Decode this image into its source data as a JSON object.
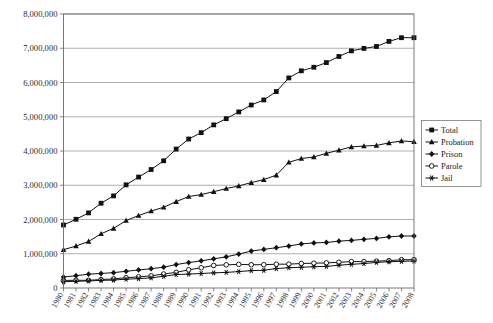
{
  "chart_data": {
    "type": "line",
    "title": "",
    "subtitle": "",
    "xlabel": "",
    "ylabel": "",
    "grid": true,
    "legend_position": "right",
    "xlim": [
      1980,
      2008
    ],
    "ylim": [
      0,
      8000000
    ],
    "ytick_values": [
      0,
      1000000,
      2000000,
      3000000,
      4000000,
      5000000,
      6000000,
      7000000,
      8000000
    ],
    "ytick_labels": [
      "0",
      "1,000,000",
      "2,000,000",
      "3,000,000",
      "4,000,000",
      "5,000,000",
      "6,000,000",
      "7,000,000",
      "8,000,000"
    ],
    "categories": [
      1980,
      1981,
      1982,
      1983,
      1984,
      1985,
      1986,
      1987,
      1988,
      1989,
      1990,
      1991,
      1992,
      1993,
      1994,
      1995,
      1996,
      1997,
      1998,
      1999,
      2000,
      2001,
      2002,
      2003,
      2004,
      2005,
      2006,
      2007,
      2008
    ],
    "xtick_labels": [
      "1980",
      "1981",
      "1982",
      "1983",
      "1984",
      "1985",
      "1986",
      "1987",
      "1988",
      "1989",
      "1990",
      "1991",
      "1992",
      "1993",
      "1994",
      "1995",
      "1996",
      "1997",
      "1998",
      "1999",
      "2000",
      "2001",
      "2002",
      "2003",
      "2004",
      "2005",
      "2006",
      "2007",
      "2008"
    ],
    "series": [
      {
        "name": "Total",
        "marker": "filled-square",
        "color": "#111111",
        "values": [
          1840400,
          2006600,
          2192600,
          2475100,
          2689200,
          3011500,
          3239400,
          3459600,
          3714100,
          4055600,
          4350300,
          4535600,
          4762600,
          4944000,
          5141300,
          5342900,
          5490700,
          5734900,
          6134200,
          6340800,
          6445100,
          6581700,
          6758800,
          6924500,
          6995000,
          7051900,
          7199700,
          7308200,
          7308200
        ]
      },
      {
        "name": "Probation",
        "marker": "filled-triangle",
        "color": "#111111",
        "values": [
          1118100,
          1225900,
          1357300,
          1582900,
          1740900,
          1968700,
          2114600,
          2247200,
          2356500,
          2522100,
          2670200,
          2728500,
          2811600,
          2903100,
          2981000,
          3077900,
          3164900,
          3296500,
          3670400,
          3779900,
          3826200,
          3931700,
          4024100,
          4120000,
          4143800,
          4162500,
          4236800,
          4293000,
          4270900
        ]
      },
      {
        "name": "Prison",
        "marker": "filled-diamond",
        "color": "#111111",
        "values": [
          319600,
          360000,
          402900,
          423900,
          448300,
          487600,
          526400,
          562800,
          607800,
          683400,
          743400,
          792500,
          850600,
          909400,
          990100,
          1078500,
          1127500,
          1176600,
          1224500,
          1287200,
          1316300,
          1330000,
          1367500,
          1390300,
          1421300,
          1448300,
          1492900,
          1517900,
          1518600
        ]
      },
      {
        "name": "Parole",
        "marker": "open-circle",
        "color": "#111111",
        "values": [
          220400,
          225200,
          224600,
          246400,
          266900,
          300200,
          325600,
          355500,
          407900,
          456800,
          531400,
          590400,
          658600,
          676100,
          690400,
          679400,
          679700,
          694800,
          696400,
          714700,
          723900,
          732300,
          750900,
          769900,
          771900,
          784400,
          798200,
          824400,
          828200
        ]
      },
      {
        "name": "Jail",
        "marker": "asterisk",
        "color": "#111111",
        "values": [
          182300,
          195100,
          207800,
          221800,
          233000,
          256600,
          274400,
          295900,
          341900,
          393300,
          405300,
          424100,
          441800,
          455500,
          479800,
          507000,
          518500,
          567100,
          592500,
          605900,
          621100,
          631200,
          665500,
          691300,
          713900,
          747500,
          765800,
          780200,
          785500
        ]
      }
    ]
  },
  "legend": {
    "entries": [
      {
        "label": "Total"
      },
      {
        "label": "Probation"
      },
      {
        "label": "Prison"
      },
      {
        "label": "Parole"
      },
      {
        "label": "Jail"
      }
    ]
  }
}
